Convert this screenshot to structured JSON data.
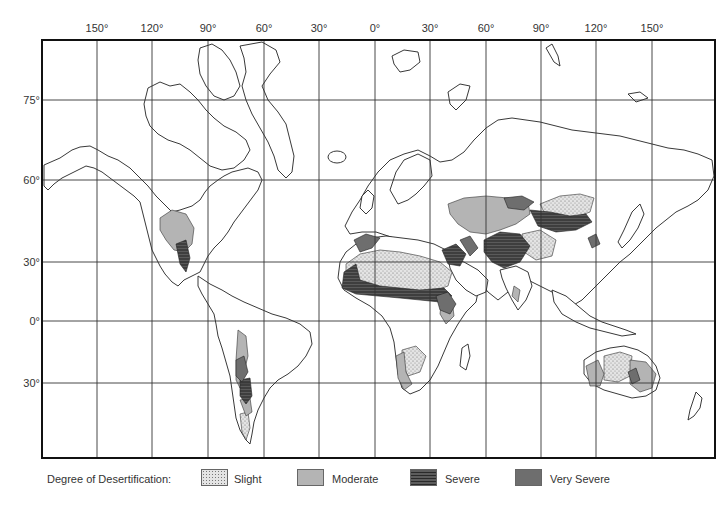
{
  "map": {
    "title": "World Desertification Map",
    "longitude_labels": [
      {
        "label": "150°",
        "x": 97
      },
      {
        "label": "120°",
        "x": 152
      },
      {
        "label": "90°",
        "x": 208
      },
      {
        "label": "60°",
        "x": 264
      },
      {
        "label": "30°",
        "x": 319
      },
      {
        "label": "0°",
        "x": 375
      },
      {
        "label": "30°",
        "x": 430
      },
      {
        "label": "60°",
        "x": 486
      },
      {
        "label": "90°",
        "x": 541
      },
      {
        "label": "120°",
        "x": 596
      },
      {
        "label": "150°",
        "x": 652
      }
    ],
    "latitude_labels": [
      {
        "label": "75°",
        "y": 100
      },
      {
        "label": "60°",
        "y": 180
      },
      {
        "label": "30°",
        "y": 262
      },
      {
        "label": "0°",
        "y": 321
      },
      {
        "label": "30°",
        "y": 383
      }
    ],
    "frame": {
      "left": 42,
      "top": 40,
      "right": 715,
      "bottom": 458
    }
  },
  "legend": {
    "title": "Degree of Desertification:",
    "items": [
      {
        "label": "Slight",
        "color": "#e4e4e4",
        "pattern": "dotted"
      },
      {
        "label": "Moderate",
        "color": "#b4b4b4",
        "pattern": "solid"
      },
      {
        "label": "Severe",
        "color": "#4a4a4a",
        "pattern": "hatched"
      },
      {
        "label": "Very Severe",
        "color": "#6e6e6e",
        "pattern": "solid"
      }
    ]
  },
  "colors": {
    "slight": "#e4e4e4",
    "moderate": "#b4b4b4",
    "severe": "#4a4a4a",
    "very_severe": "#6e6e6e",
    "grid": "#333333",
    "coast": "#222222"
  }
}
